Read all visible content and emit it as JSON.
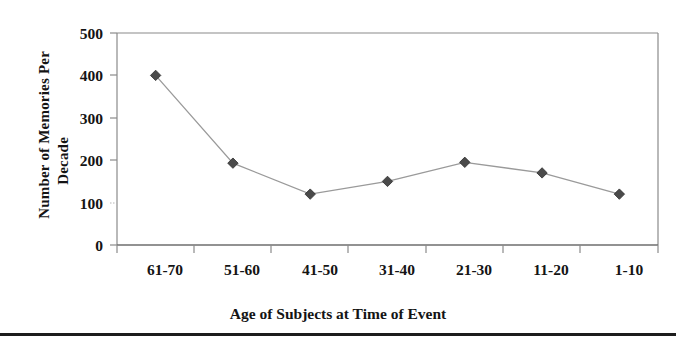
{
  "chart_data": {
    "type": "line",
    "title": "",
    "subtitle": "",
    "xlabel": "Age of Subjects at Time of Event",
    "ylabel": "Number of Memories Per Decade",
    "ylabel_lines": [
      "Number of Memories Per",
      "Decade"
    ],
    "categories": [
      "61-70",
      "51-60",
      "41-50",
      "31-40",
      "21-30",
      "11-20",
      "1-10"
    ],
    "values": [
      400,
      193,
      120,
      150,
      195,
      170,
      120
    ],
    "series": [
      {
        "name": "Number of Memories Per Decade",
        "values": [
          400,
          193,
          120,
          150,
          195,
          170,
          120
        ]
      }
    ],
    "ylim": [
      0,
      500
    ],
    "yticks": [
      0,
      100,
      200,
      300,
      400,
      500
    ],
    "ytick_labels": [
      "0",
      "100",
      "200",
      "300",
      "400",
      "500"
    ],
    "grid": false,
    "legend": false,
    "legend_position": "none",
    "marker": "diamond",
    "marker_color": "#4a4a4a",
    "line_color": "#8c8c8c",
    "axis_color": "#808080",
    "text_color": "#141414",
    "background": "#ffffff"
  },
  "figure": {
    "frame_rule_color": "#1d1d1d"
  }
}
